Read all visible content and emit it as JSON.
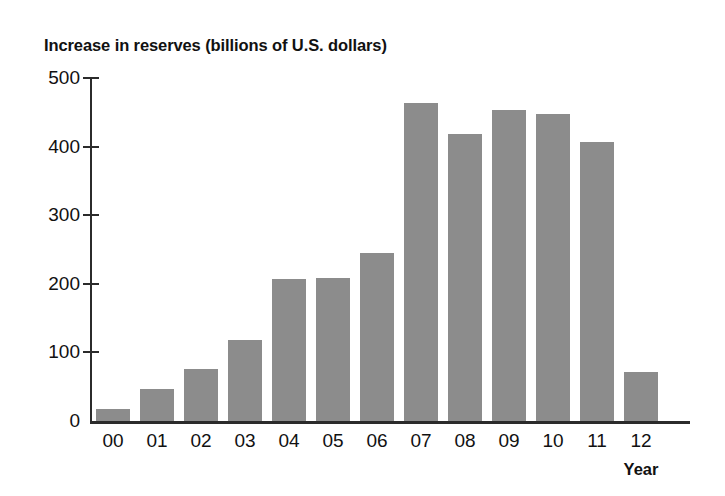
{
  "chart_data": {
    "type": "bar",
    "title": "Increase in reserves (billions of U.S. dollars)",
    "xlabel": "Year",
    "ylabel": "",
    "categories": [
      "00",
      "01",
      "02",
      "03",
      "04",
      "05",
      "06",
      "07",
      "08",
      "09",
      "10",
      "11",
      "12"
    ],
    "values": [
      18,
      47,
      76,
      118,
      207,
      208,
      245,
      464,
      418,
      453,
      448,
      407,
      72
    ],
    "series": [
      {
        "name": "Increase in reserves",
        "values": [
          18,
          47,
          76,
          118,
          207,
          208,
          245,
          464,
          418,
          453,
          448,
          407,
          72
        ]
      }
    ],
    "ylim": [
      0,
      500
    ],
    "yticks": [
      0,
      100,
      200,
      300,
      400,
      500
    ],
    "ytick_labels": [
      "0",
      "100",
      "200",
      "300",
      "400",
      "500"
    ],
    "grid": false,
    "legend": false,
    "legend_position": "none",
    "bar_color": "#8c8c8c",
    "axis_color": "#2b2b2b",
    "text_color": "#111111",
    "background_color": "#ffffff"
  }
}
